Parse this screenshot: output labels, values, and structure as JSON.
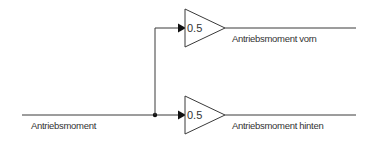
{
  "diagram": {
    "type": "simulink-block-diagram",
    "input_signal": {
      "label": "Antriebsmoment"
    },
    "gain_blocks": [
      {
        "id": "gain-front",
        "gain_value": "0.5",
        "output_label": "Antriebsmoment vorn"
      },
      {
        "id": "gain-rear",
        "gain_value": "0.5",
        "output_label": "Antriebsmoment hinten"
      }
    ],
    "colors": {
      "line": "#3a3a3a",
      "arrow": "#111111",
      "text": "#333333",
      "background": "#ffffff"
    }
  }
}
